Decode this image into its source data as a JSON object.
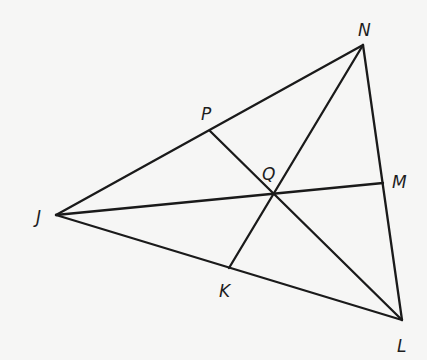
{
  "diagram": {
    "points": {
      "J": {
        "x": 56,
        "y": 215
      },
      "N": {
        "x": 363,
        "y": 45
      },
      "L": {
        "x": 402,
        "y": 320
      },
      "P": {
        "x": 210,
        "y": 131
      },
      "M": {
        "x": 383,
        "y": 183
      },
      "K": {
        "x": 229,
        "y": 268
      },
      "Q": {
        "x": 273,
        "y": 193
      }
    },
    "segments": [
      {
        "name": "side-JN",
        "from": "J",
        "to": "N"
      },
      {
        "name": "side-NL",
        "from": "N",
        "to": "L"
      },
      {
        "name": "side-LJ",
        "from": "L",
        "to": "J"
      },
      {
        "name": "cevian-JM",
        "from": "J",
        "to": "M"
      },
      {
        "name": "cevian-NK",
        "from": "N",
        "to": "K"
      },
      {
        "name": "cevian-PL",
        "from": "P",
        "to": "L"
      }
    ],
    "labels": {
      "N": {
        "text": "N",
        "x": 358,
        "y": 36
      },
      "P": {
        "text": "P",
        "x": 201,
        "y": 120
      },
      "Q": {
        "text": "Q",
        "x": 262,
        "y": 180
      },
      "M": {
        "text": "M",
        "x": 392,
        "y": 188
      },
      "J": {
        "text": "J",
        "x": 36,
        "y": 223
      },
      "K": {
        "text": "K",
        "x": 219,
        "y": 297
      },
      "L": {
        "text": "L",
        "x": 397,
        "y": 352
      }
    },
    "colors": {
      "stroke": "#1a1a1a",
      "label": "#1e1e1e",
      "background": "#f6f6f5"
    }
  }
}
